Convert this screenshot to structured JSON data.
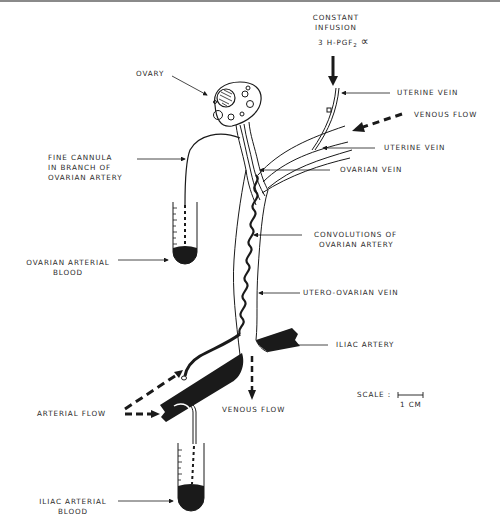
{
  "figure": {
    "type": "anatomical-schematic"
  },
  "labels": {
    "constant_infusion_line1": "CONSTANT",
    "constant_infusion_line2": "INFUSION",
    "tracer_prefix": "3 H-PGF",
    "tracer_subscript": "2",
    "tracer_suffix": "∝",
    "ovary": "OVARY",
    "uterine_vein_upper": "UTERINE VEIN",
    "venous_flow_upper": "VENOUS  FLOW",
    "uterine_vein_lower": "UTERINE VEIN",
    "fine_cannula_line1": "FINE CANNULA",
    "fine_cannula_line2": "IN BRANCH OF",
    "fine_cannula_line3": "OVARIAN ARTERY",
    "ovarian_vein": "OVARIAN VEIN",
    "convolutions_line1": "CONVOLUTIONS OF",
    "convolutions_line2": "OVARIAN ARTERY",
    "ovarian_arterial_blood_line1": "OVARIAN ARTERIAL",
    "ovarian_arterial_blood_line2": "BLOOD",
    "utero_ovarian_vein": "UTERO-OVARIAN VEIN",
    "iliac_artery": "ILIAC ARTERY",
    "scale_label": "SCALE :",
    "scale_unit": "1 CM",
    "arterial_flow": "ARTERIAL FLOW",
    "venous_flow_lower": "VENOUS FLOW",
    "iliac_arterial_blood_line1": "ILIAC ARTERIAL",
    "iliac_arterial_blood_line2": "BLOOD"
  },
  "colors": {
    "ink": "#1a1a1a",
    "text": "#2a2a2a",
    "background": "#ffffff"
  }
}
